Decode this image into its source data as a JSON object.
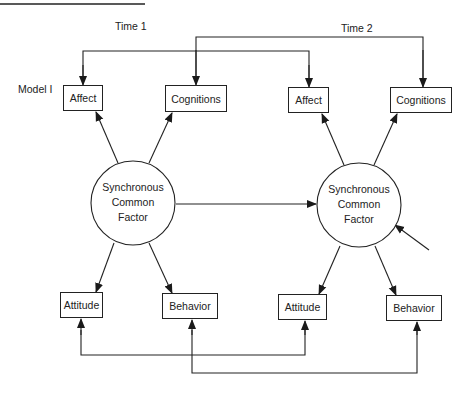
{
  "model_label": "Model I",
  "time_labels": {
    "time1": "Time 1",
    "time2": "Time 2"
  },
  "time1": {
    "affect": "Affect",
    "cognitions": "Cognitions",
    "factor": {
      "line1": "Synchronous",
      "line2": "Common",
      "line3": "Factor"
    },
    "attitude": "Attitude",
    "behavior": "Behavior"
  },
  "time2": {
    "affect": "Affect",
    "cognitions": "Cognitions",
    "factor": {
      "line1": "Synchronous",
      "line2": "Common",
      "line3": "Factor"
    },
    "attitude": "Attitude",
    "behavior": "Behavior"
  },
  "edges": [
    {
      "from": "Factor (Time 1)",
      "to": "Affect (Time 1)"
    },
    {
      "from": "Factor (Time 1)",
      "to": "Cognitions (Time 1)"
    },
    {
      "from": "Factor (Time 1)",
      "to": "Attitude (Time 1)"
    },
    {
      "from": "Factor (Time 1)",
      "to": "Behavior (Time 1)"
    },
    {
      "from": "Factor (Time 2)",
      "to": "Affect (Time 2)"
    },
    {
      "from": "Factor (Time 2)",
      "to": "Cognitions (Time 2)"
    },
    {
      "from": "Factor (Time 2)",
      "to": "Attitude (Time 2)"
    },
    {
      "from": "Factor (Time 2)",
      "to": "Behavior (Time 2)"
    },
    {
      "from": "Factor (Time 1)",
      "to": "Factor (Time 2)"
    },
    {
      "from": "Disturbance",
      "to": "Factor (Time 2)"
    },
    {
      "from": "Affect (Time 2)",
      "to": "Affect (Time 1)",
      "type": "correlated-error"
    },
    {
      "from": "Cognitions (Time 2)",
      "to": "Cognitions (Time 1)",
      "type": "correlated-error"
    },
    {
      "from": "Attitude (Time 1)",
      "to": "Attitude (Time 2)",
      "type": "correlated-error"
    },
    {
      "from": "Behavior (Time 1)",
      "to": "Behavior (Time 2)",
      "type": "correlated-error"
    }
  ]
}
